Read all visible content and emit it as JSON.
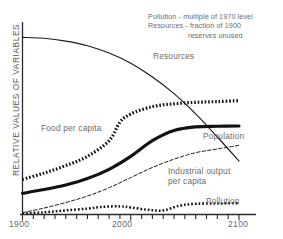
{
  "chart_data": {
    "type": "line",
    "title": "",
    "subtitle": "",
    "xlabel": "",
    "ylabel": "RELATIVE VALUES OF VARIABLES",
    "xlim": [
      1900,
      2100
    ],
    "ylim": [
      0,
      1
    ],
    "grid": false,
    "legend_position": "inline-annotations",
    "xticks": [
      1900,
      2000,
      2100
    ],
    "xtick_labels": [
      "1900",
      "2000",
      "2100"
    ],
    "minor_tick_interval": 10,
    "yticks": [],
    "ytick_labels": [],
    "annotations": [
      "Pollution - multiple of 1970 level",
      "Resources - fraction of 1900",
      "reserves unused"
    ],
    "series": [
      {
        "name": "Resources",
        "label": "Resources",
        "style": "thin-solid",
        "color": "#1a1a1a",
        "x": [
          1900,
          1920,
          1940,
          1960,
          1980,
          2000,
          2020,
          2040,
          2060,
          2080,
          2100
        ],
        "values": [
          0.96,
          0.955,
          0.94,
          0.915,
          0.875,
          0.82,
          0.745,
          0.655,
          0.545,
          0.42,
          0.29
        ]
      },
      {
        "name": "Food per capita",
        "label": "Food per capita",
        "style": "thick-dotted",
        "color": "#111111",
        "x": [
          1900,
          1920,
          1940,
          1960,
          1980,
          1990,
          2000,
          2020,
          2040,
          2060,
          2080,
          2100
        ],
        "values": [
          0.19,
          0.225,
          0.265,
          0.315,
          0.4,
          0.5,
          0.545,
          0.585,
          0.6,
          0.608,
          0.612,
          0.617
        ]
      },
      {
        "name": "Population",
        "label": "Population",
        "style": "thick-solid",
        "color": "#111111",
        "x": [
          1900,
          1920,
          1940,
          1960,
          1980,
          2000,
          2020,
          2040,
          2060,
          2080,
          2100
        ],
        "values": [
          0.115,
          0.135,
          0.16,
          0.195,
          0.245,
          0.315,
          0.4,
          0.455,
          0.475,
          0.478,
          0.48
        ]
      },
      {
        "name": "Industrial output per capita",
        "label": "Industrial output\nper capita",
        "style": "thin-dashed",
        "color": "#1a1a1a",
        "x": [
          1900,
          1920,
          1940,
          1960,
          1980,
          2000,
          2020,
          2040,
          2060,
          2080,
          2100
        ],
        "values": [
          0.01,
          0.035,
          0.065,
          0.1,
          0.145,
          0.2,
          0.255,
          0.3,
          0.335,
          0.355,
          0.375
        ]
      },
      {
        "name": "Pollution",
        "label": "Pollution",
        "style": "medium-dotted",
        "color": "#111111",
        "x": [
          1900,
          1920,
          1940,
          1960,
          1975,
          1990,
          2000,
          2015,
          2030,
          2045,
          2060,
          2080,
          2100
        ],
        "values": [
          0.005,
          0.012,
          0.022,
          0.032,
          0.042,
          0.044,
          0.038,
          0.026,
          0.022,
          0.048,
          0.058,
          0.06,
          0.061
        ]
      }
    ]
  },
  "axis": {
    "y_title": "RELATIVE VALUES OF VARIABLES",
    "x_left": "1900",
    "x_mid": "2000",
    "x_right": "2100"
  },
  "notes": {
    "line1": "Pollution - multiple of 1970 level",
    "line2": "Resources - fraction of 1900",
    "line3": "reserves unused"
  },
  "labels": {
    "resources": "Resources",
    "food": "Food per capita",
    "population": "Population",
    "industrial_l1": "Industrial output",
    "industrial_l2": "per capita",
    "pollution": "Pollution"
  }
}
